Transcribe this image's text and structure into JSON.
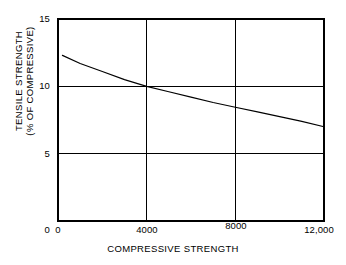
{
  "chart_data": {
    "type": "line",
    "title": "",
    "subtitle": "",
    "xlabel": "COMPRESSIVE STRENGTH",
    "ylabel_line1": "TENSILE STRENGTH",
    "ylabel_line2": "(% OF COMPRESSIVE)",
    "ylabel": "TENSILE STRENGTH (% OF COMPRESSIVE)",
    "xlim": [
      0,
      12000
    ],
    "ylim": [
      0,
      15
    ],
    "xticks": [
      0,
      4000,
      8000,
      12000
    ],
    "xtick_labels": [
      "0",
      "4000",
      "8000",
      "12,000"
    ],
    "yticks": [
      0,
      5,
      10,
      15
    ],
    "ytick_labels": [
      "0",
      "5",
      "10",
      "15"
    ],
    "grid": true,
    "gridlines_x": [
      4000,
      8000
    ],
    "gridlines_y": [
      5,
      10
    ],
    "legend": null,
    "legend_position": "none",
    "line_color": "#000000",
    "frame_color": "#000000",
    "background": "#ffffff",
    "series": [
      {
        "name": "tensile strength ratio",
        "x": [
          200,
          1000,
          2000,
          3000,
          4000,
          5000,
          6000,
          7000,
          8000,
          9000,
          10000,
          11000,
          12000
        ],
        "y": [
          12.3,
          11.7,
          11.1,
          10.5,
          10.0,
          9.6,
          9.2,
          8.8,
          8.45,
          8.1,
          7.75,
          7.4,
          7.0
        ]
      }
    ],
    "annotations": []
  },
  "axis": {
    "y_ticks": [
      {
        "label": "15",
        "value": 15
      },
      {
        "label": "10",
        "value": 10
      },
      {
        "label": "5",
        "value": 5
      },
      {
        "label": "0",
        "value": 0
      }
    ],
    "x_ticks": [
      {
        "label": "0",
        "value": 0
      },
      {
        "label": "4000",
        "value": 4000
      },
      {
        "label": "8000",
        "value": 8000
      },
      {
        "label": "12,000",
        "value": 12000
      }
    ]
  },
  "titles": {
    "x_axis": "COMPRESSIVE STRENGTH",
    "y_axis_line1": "TENSILE STRENGTH",
    "y_axis_line2": "(% OF COMPRESSIVE)"
  }
}
